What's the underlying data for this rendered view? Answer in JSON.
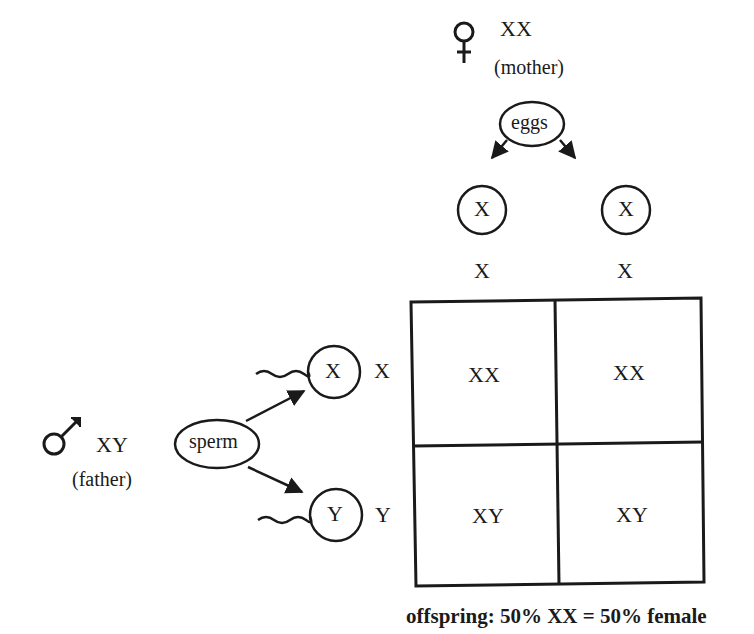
{
  "mother": {
    "symbol": "female-symbol",
    "genotype": "XX",
    "label": "(mother)",
    "gamete_source": "eggs",
    "gametes": [
      "X",
      "X"
    ],
    "column_headers": [
      "X",
      "X"
    ]
  },
  "father": {
    "symbol": "male-symbol",
    "genotype": "XY",
    "label": "(father)",
    "gamete_source": "sperm",
    "gametes": [
      "X",
      "Y"
    ],
    "row_headers": [
      "X",
      "Y"
    ]
  },
  "punnett": {
    "cells": [
      [
        "XX",
        "XX"
      ],
      [
        "XY",
        "XY"
      ]
    ]
  },
  "caption": "offspring: 50% XX = 50% female",
  "colors": {
    "ink": "#1a1a1a",
    "background": "#ffffff"
  }
}
